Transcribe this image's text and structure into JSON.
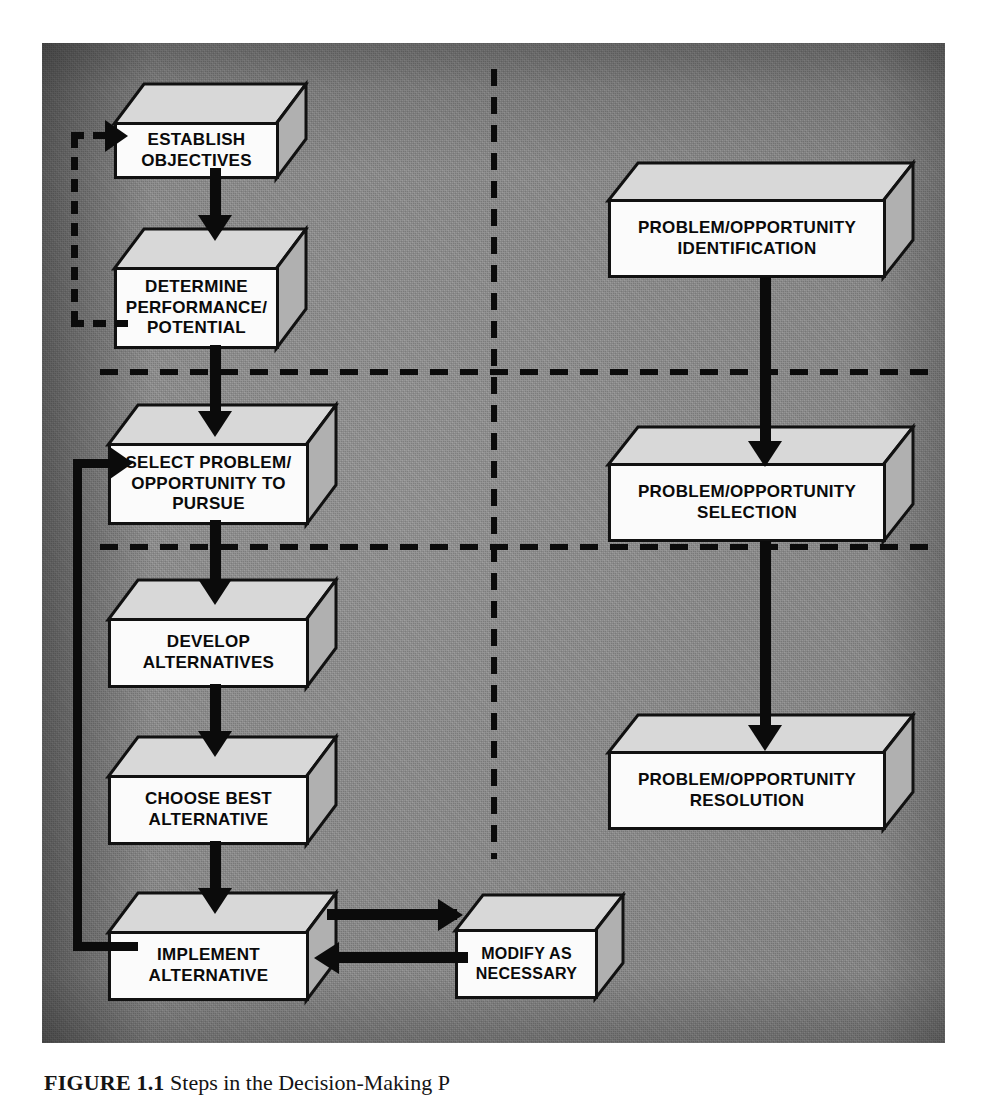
{
  "figure": {
    "caption_label": "FIGURE 1.1",
    "caption_text": "Steps in the Decision-Making P",
    "panel_color": "#8b8b8b",
    "box_front_color": "#fbfbfb",
    "box_top_color": "#d8d8d8",
    "box_side_color": "#b0b0b0",
    "line_color": "#0b0b0b"
  },
  "left_column": {
    "title": "Decision-Making Steps",
    "boxes": [
      {
        "id": "establish-objectives",
        "label": "ESTABLISH\nOBJECTIVES"
      },
      {
        "id": "determine-performance",
        "label": "DETERMINE\nPERFORMANCE/\nPOTENTIAL"
      },
      {
        "id": "select-problem",
        "label": "SELECT PROBLEM/\nOPPORTUNITY TO\nPURSUE"
      },
      {
        "id": "develop-alternatives",
        "label": "DEVELOP\nALTERNATIVES"
      },
      {
        "id": "choose-best",
        "label": "CHOOSE BEST\nALTERNATIVE"
      },
      {
        "id": "implement-alternative",
        "label": "IMPLEMENT\nALTERNATIVE"
      }
    ]
  },
  "right_column": {
    "title": "Decision-Making Phases",
    "boxes": [
      {
        "id": "problem-identification",
        "label": "PROBLEM/OPPORTUNITY\nIDENTIFICATION"
      },
      {
        "id": "problem-selection",
        "label": "PROBLEM/OPPORTUNITY\nSELECTION"
      },
      {
        "id": "problem-resolution",
        "label": "PROBLEM/OPPORTUNITY\nRESOLUTION"
      }
    ]
  },
  "aux_boxes": [
    {
      "id": "modify-as-necessary",
      "label": "MODIFY AS\nNECESSARY"
    }
  ],
  "connectors": {
    "feedback_dashed_label": "feedback loop: determine performance to establish objectives",
    "feedback_solid_label": "feedback loop: implement alternative to select problem",
    "modify_out_label": "implement alternative to modify as necessary",
    "modify_back_label": "modify as necessary to implement alternative"
  },
  "dividers": {
    "vertical_label": "phase column divider",
    "horizontal_labels": [
      "identification / selection phase divider",
      "selection / resolution phase divider"
    ]
  }
}
